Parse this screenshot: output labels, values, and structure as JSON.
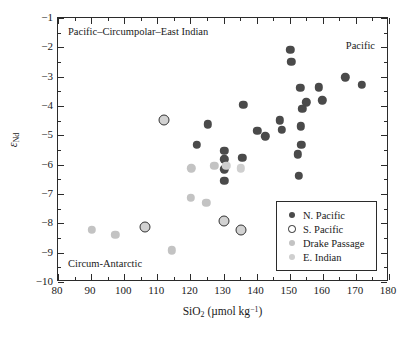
{
  "chart_data": {
    "type": "scatter",
    "title": "",
    "xlabel": "SiO2 (µmol kg-1)",
    "ylabel": "eNd",
    "xlim": [
      80,
      180
    ],
    "ylim": [
      -10,
      -1
    ],
    "x_major_ticks": [
      80,
      90,
      100,
      110,
      120,
      130,
      140,
      150,
      160,
      170,
      180
    ],
    "x_minor_step": 5,
    "y_major_ticks": [
      -1,
      -2,
      -3,
      -4,
      -5,
      -6,
      -7,
      -8,
      -9,
      -10
    ],
    "y_minor_step": 0.5,
    "x_tick_labels": [
      "80",
      "90",
      "100",
      "110",
      "120",
      "130",
      "140",
      "150",
      "160",
      "170",
      "180"
    ],
    "y_tick_labels": [
      "−1",
      "−2",
      "−3",
      "−4",
      "−5",
      "−6",
      "−7",
      "−8",
      "−9",
      "−10"
    ],
    "grid": false,
    "legend_position": "lower-right-inside",
    "series": [
      {
        "name": "N. Pacific",
        "marker": "filled-circle",
        "color": "#4a4a4a",
        "points": [
          [
            150.2,
            -2.09
          ],
          [
            150.5,
            -2.5
          ],
          [
            166.8,
            -3.02
          ],
          [
            171.8,
            -3.28
          ],
          [
            153.2,
            -3.37
          ],
          [
            158.8,
            -3.36
          ],
          [
            155.0,
            -3.88
          ],
          [
            159.8,
            -3.81
          ],
          [
            153.8,
            -4.1
          ],
          [
            136.0,
            -3.96
          ],
          [
            147.0,
            -4.49
          ],
          [
            147.6,
            -4.81
          ],
          [
            153.3,
            -4.69
          ],
          [
            125.2,
            -4.62
          ],
          [
            140.2,
            -4.85
          ],
          [
            142.6,
            -5.03
          ],
          [
            153.5,
            -5.33
          ],
          [
            122.0,
            -5.33
          ],
          [
            152.5,
            -5.65
          ],
          [
            130.3,
            -5.53
          ],
          [
            130.3,
            -5.82
          ],
          [
            135.7,
            -5.77
          ],
          [
            130.3,
            -6.16
          ],
          [
            130.3,
            -6.56
          ],
          [
            152.8,
            -6.39
          ]
        ]
      },
      {
        "name": "S. Pacific",
        "marker": "open-circle",
        "color": "#d2d2d2",
        "edge_color": "#333333",
        "points": [
          [
            112.0,
            -4.48
          ],
          [
            106.2,
            -8.12
          ],
          [
            130.2,
            -7.92
          ],
          [
            135.2,
            -8.23
          ]
        ]
      },
      {
        "name": "Drake Passage",
        "marker": "filled-circle",
        "color": "#c3c3c3",
        "points": [
          [
            120.3,
            -6.13
          ],
          [
            127.2,
            -6.03
          ],
          [
            120.2,
            -7.13
          ],
          [
            124.8,
            -7.31
          ],
          [
            90.2,
            -8.22
          ],
          [
            97.3,
            -8.4
          ],
          [
            114.3,
            -8.92
          ]
        ]
      },
      {
        "name": "E. Indian",
        "marker": "filled-circle",
        "color": "#cfcfcf",
        "points": [
          [
            130.8,
            -6.03
          ],
          [
            135.3,
            -6.13
          ]
        ]
      }
    ],
    "annotations": [
      {
        "id": "pacific-circumpolar",
        "text": "Pacific–Circumpolar–East Indian"
      },
      {
        "id": "pacific",
        "text": "Pacific"
      },
      {
        "id": "circum-antarctic",
        "text": "Circum-Antarctic"
      }
    ]
  },
  "legend": {
    "entries": [
      {
        "label": "N. Pacific"
      },
      {
        "label": "S. Pacific"
      },
      {
        "label": "Drake Passage"
      },
      {
        "label": "E. Indian"
      }
    ]
  }
}
